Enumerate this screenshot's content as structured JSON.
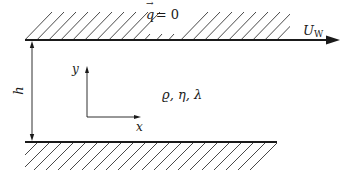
{
  "diagram": {
    "type": "couette-flow-channel",
    "top_wall": {
      "condition_label": "q⃗ = 0",
      "condition_symbol": "q",
      "condition_rhs": "= 0",
      "velocity_label": "U",
      "velocity_subscript": "W"
    },
    "bottom_wall": {},
    "gap_label": "h",
    "axes": {
      "x_label": "x",
      "y_label": "y"
    },
    "fluid_properties_label": "ϱ, η, λ",
    "colors": {
      "line": "#1a1a1a",
      "background": "#ffffff"
    }
  }
}
